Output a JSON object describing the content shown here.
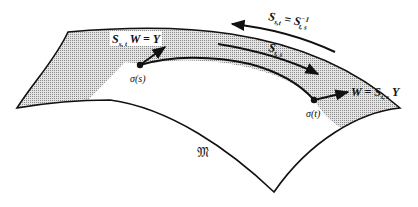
{
  "diagram": {
    "type": "manifold-parallel-transport",
    "manifold_label": "𝔐",
    "points": [
      {
        "id": "sigma_s",
        "label": "σ(s)"
      },
      {
        "id": "sigma_t",
        "label": "σ(t)"
      }
    ],
    "labels": {
      "vector_at_s": {
        "main": "S",
        "sub": "s, t",
        "rest": " W = Y"
      },
      "vector_at_t": {
        "main": "W = S",
        "sub": "t, s",
        "rest": " Y"
      },
      "forward_transport": {
        "main": "S",
        "sub": "t, s"
      },
      "backward_transport": {
        "main": "S",
        "sub": "s,t",
        "eq": " = S",
        "sup": "−1",
        "sub2": "t, s"
      }
    },
    "colors": {
      "stroke": "#111111",
      "shade": "#cfcfcf",
      "background": "#ffffff"
    }
  }
}
